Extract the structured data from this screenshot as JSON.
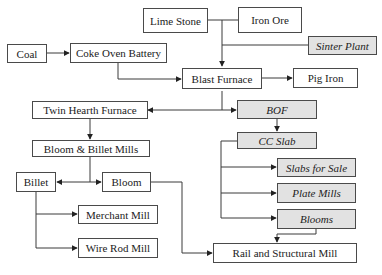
{
  "diagram": {
    "type": "flowchart",
    "colors": {
      "border": "#4a4a4a",
      "shaded_fill": "#e2e2e2",
      "plain_fill": "#ffffff",
      "line": "#3a3a3a"
    },
    "nodes": {
      "lime_stone": {
        "label": "Lime Stone",
        "shaded": false
      },
      "iron_ore": {
        "label": "Iron Ore",
        "shaded": false
      },
      "sinter_plant": {
        "label": "Sinter Plant",
        "shaded": true
      },
      "coal": {
        "label": "Coal",
        "shaded": false
      },
      "coke_oven_battery": {
        "label": "Coke Oven Battery",
        "shaded": false
      },
      "blast_furnace": {
        "label": "Blast Furnace",
        "shaded": false
      },
      "pig_iron": {
        "label": "Pig Iron",
        "shaded": false
      },
      "twin_hearth_furnace": {
        "label": "Twin Hearth Furnace",
        "shaded": false
      },
      "bof": {
        "label": "BOF",
        "shaded": true
      },
      "bloom_billet_mills": {
        "label": "Bloom & Billet Mills",
        "shaded": false
      },
      "cc_slab": {
        "label": "CC Slab",
        "shaded": true
      },
      "billet": {
        "label": "Billet",
        "shaded": false
      },
      "bloom": {
        "label": "Bloom",
        "shaded": false
      },
      "slabs_for_sale": {
        "label": "Slabs for Sale",
        "shaded": true
      },
      "plate_mills": {
        "label": "Plate Mills",
        "shaded": true
      },
      "merchant_mill": {
        "label": "Merchant Mill",
        "shaded": false
      },
      "blooms": {
        "label": "Blooms",
        "shaded": true
      },
      "wire_rod_mill": {
        "label": "Wire Rod Mill",
        "shaded": false
      },
      "rail_structural_mill": {
        "label": "Rail and Structural Mill",
        "shaded": false
      }
    },
    "edges": [
      {
        "from": "Lime Stone",
        "to": "Blast Furnace"
      },
      {
        "from": "Iron Ore",
        "to": "Blast Furnace"
      },
      {
        "from": "Sinter Plant",
        "to": "Blast Furnace"
      },
      {
        "from": "Coal",
        "to": "Coke Oven Battery"
      },
      {
        "from": "Coke Oven Battery",
        "to": "Blast Furnace"
      },
      {
        "from": "Blast Furnace",
        "to": "Pig Iron"
      },
      {
        "from": "Blast Furnace",
        "to": "Twin Hearth Furnace"
      },
      {
        "from": "Blast Furnace",
        "to": "BOF"
      },
      {
        "from": "Twin Hearth Furnace",
        "to": "Bloom & Billet Mills"
      },
      {
        "from": "BOF",
        "to": "CC Slab"
      },
      {
        "from": "Bloom & Billet Mills",
        "to": "Billet"
      },
      {
        "from": "Bloom & Billet Mills",
        "to": "Bloom"
      },
      {
        "from": "CC Slab",
        "to": "Slabs for Sale"
      },
      {
        "from": "CC Slab",
        "to": "Plate Mills"
      },
      {
        "from": "CC Slab",
        "to": "Blooms"
      },
      {
        "from": "Billet",
        "to": "Merchant Mill"
      },
      {
        "from": "Billet",
        "to": "Wire Rod Mill"
      },
      {
        "from": "Bloom",
        "to": "Rail and Structural Mill"
      },
      {
        "from": "Blooms",
        "to": "Rail and Structural Mill"
      }
    ]
  }
}
